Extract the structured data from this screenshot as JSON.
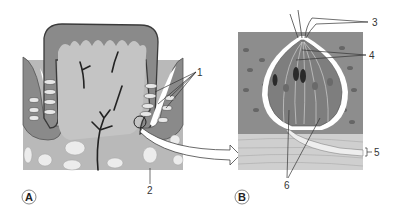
{
  "figure": {
    "panels": [
      {
        "id": "A",
        "label": "A",
        "description": "Papilla with taste buds in the trench walls and serous glands below"
      },
      {
        "id": "B",
        "label": "B",
        "description": "Enlarged taste bud embedded in stratified epithelium"
      }
    ],
    "callouts": {
      "a1": "1",
      "a2": "2",
      "b3": "3",
      "b4": "4",
      "b5": "5",
      "b6": "6"
    },
    "colors": {
      "tissue_dark": "#7a7a7a",
      "tissue_mid": "#a8a8a8",
      "tissue_light": "#cfcfcf",
      "outline": "#3a3a3a",
      "white": "#ffffff"
    }
  }
}
